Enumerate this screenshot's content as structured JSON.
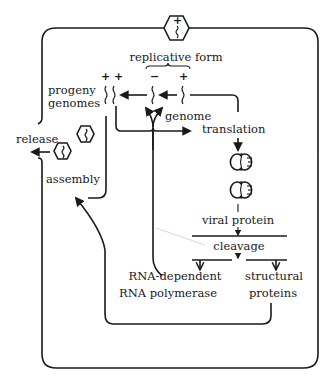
{
  "diagram": {
    "labels": {
      "replicative_form": "replicative form",
      "progeny_line1": "progeny",
      "progeny_line2": "genomes",
      "genome": "genome",
      "translation": "translation",
      "release": "release",
      "assembly": "assembly",
      "viral_protein": "viral protein",
      "cleavage": "cleavage",
      "rdrp_line1": "RNA-dependent",
      "rdrp_line2": "RNA polymerase",
      "structural_line1": "structural",
      "structural_line2": "proteins"
    },
    "strand_signs": {
      "progeny": "+ +",
      "replicative_minus": "−",
      "replicative_plus": "+",
      "virion": "+"
    },
    "colors": {
      "ink": "#1a1a1a",
      "background": "#ffffff"
    }
  }
}
